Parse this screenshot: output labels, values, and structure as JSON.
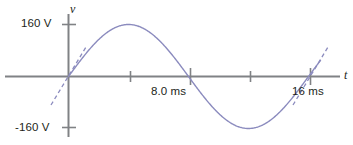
{
  "figure": {
    "kind": "sine-voltage-waveform",
    "background_color": "#ffffff",
    "axis_color": "#808285",
    "curve_color": "#8b8bbe",
    "text_color": "#231f20"
  },
  "axes": {
    "y_axis_label": "v",
    "x_axis_label": "t",
    "y_ticks": [
      {
        "label": "160 V",
        "value": 160
      },
      {
        "label": "-160 V",
        "value": -160
      }
    ],
    "x_ticks": [
      {
        "label": "",
        "value": 4
      },
      {
        "label": "8.0 ms",
        "value": 8
      },
      {
        "label": "",
        "value": 12
      },
      {
        "label": "16 ms",
        "value": 16
      }
    ]
  },
  "chart_data": {
    "type": "line",
    "title": "",
    "subtitle": "",
    "xlabel": "t",
    "ylabel": "v",
    "xlim": [
      -1,
      18.2
    ],
    "ylim": [
      -190,
      190
    ],
    "xunit": "ms",
    "yunit": "V",
    "grid": false,
    "legend": null,
    "xticks": [
      4,
      8,
      12,
      16
    ],
    "xticklabels": [
      "",
      "8.0 ms",
      "",
      "16 ms"
    ],
    "yticks": [
      160,
      -160
    ],
    "yticklabels": [
      "160 V",
      "-160 V"
    ],
    "series": [
      {
        "name": "v(t)",
        "kind": "sine",
        "amplitude": 160,
        "period": 16,
        "phase": 0,
        "equation": "v = 160 sin(2*pi*t/16)",
        "color": "#8b8bbe",
        "x": [
          0,
          1,
          2,
          3,
          4,
          5,
          6,
          7,
          8,
          9,
          10,
          11,
          12,
          13,
          14,
          15,
          16
        ],
        "values": [
          0,
          61.2,
          113.1,
          147.8,
          160,
          147.8,
          113.1,
          61.2,
          0,
          -61.2,
          -113.1,
          -147.8,
          -160,
          -147.8,
          -113.1,
          -61.2,
          0
        ]
      }
    ],
    "annotations": [
      {
        "kind": "tangent-dashed-line",
        "at_x": 0,
        "at_y": 0,
        "description": "dashed tangent to the sine curve at t = 0 ms"
      },
      {
        "kind": "tangent-dashed-line",
        "at_x": 16,
        "at_y": 0,
        "description": "dashed tangent to the sine curve at t = 16 ms"
      }
    ]
  }
}
